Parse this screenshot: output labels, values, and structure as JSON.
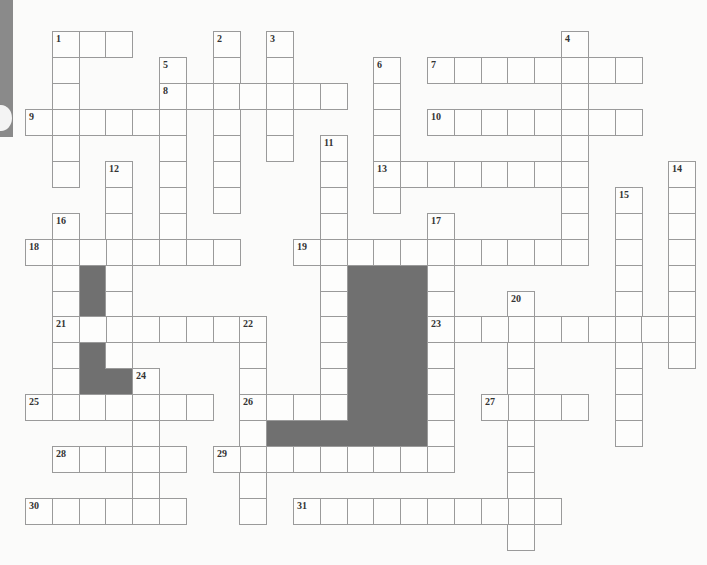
{
  "puzzle": {
    "type": "crossword",
    "grid_origin": {
      "x": 25,
      "y": 31
    },
    "cell_w": 26.8,
    "cell_h": 25.95,
    "colors": {
      "cell_border": "#9a9a9a",
      "block": "#707070",
      "background": "#fbfbfa",
      "edge_tab": "#8a8a8a"
    },
    "entries": [
      {
        "num": "1",
        "dir": "across",
        "row": 0,
        "col": 1,
        "len": 3
      },
      {
        "num": "1",
        "dir": "down",
        "row": 0,
        "col": 1,
        "len": 6
      },
      {
        "num": "2",
        "dir": "down",
        "row": 0,
        "col": 7,
        "len": 7
      },
      {
        "num": "3",
        "dir": "down",
        "row": 0,
        "col": 9,
        "len": 5
      },
      {
        "num": "4",
        "dir": "down",
        "row": 0,
        "col": 20,
        "len": 9
      },
      {
        "num": "5",
        "dir": "down",
        "row": 1,
        "col": 5,
        "len": 8
      },
      {
        "num": "6",
        "dir": "down",
        "row": 1,
        "col": 13,
        "len": 6
      },
      {
        "num": "7",
        "dir": "across",
        "row": 1,
        "col": 15,
        "len": 8
      },
      {
        "num": "8",
        "dir": "across",
        "row": 2,
        "col": 5,
        "len": 7
      },
      {
        "num": "9",
        "dir": "across",
        "row": 3,
        "col": 0,
        "len": 6
      },
      {
        "num": "10",
        "dir": "across",
        "row": 3,
        "col": 15,
        "len": 8
      },
      {
        "num": "11",
        "dir": "down",
        "row": 4,
        "col": 11,
        "len": 11
      },
      {
        "num": "12",
        "dir": "down",
        "row": 5,
        "col": 3,
        "len": 8
      },
      {
        "num": "13",
        "dir": "across",
        "row": 5,
        "col": 13,
        "len": 8
      },
      {
        "num": "14",
        "dir": "down",
        "row": 5,
        "col": 24,
        "len": 8
      },
      {
        "num": "15",
        "dir": "down",
        "row": 6,
        "col": 22,
        "len": 10
      },
      {
        "num": "16",
        "dir": "down",
        "row": 7,
        "col": 1,
        "len": 7
      },
      {
        "num": "17",
        "dir": "down",
        "row": 7,
        "col": 15,
        "len": 10
      },
      {
        "num": "18",
        "dir": "across",
        "row": 8,
        "col": 0,
        "len": 8
      },
      {
        "num": "19",
        "dir": "across",
        "row": 8,
        "col": 10,
        "len": 11
      },
      {
        "num": "20",
        "dir": "down",
        "row": 10,
        "col": 18,
        "len": 10
      },
      {
        "num": "21",
        "dir": "across",
        "row": 11,
        "col": 1,
        "len": 8
      },
      {
        "num": "22",
        "dir": "down",
        "row": 11,
        "col": 8,
        "len": 8
      },
      {
        "num": "23",
        "dir": "across",
        "row": 11,
        "col": 15,
        "len": 10
      },
      {
        "num": "24",
        "dir": "down",
        "row": 13,
        "col": 4,
        "len": 6
      },
      {
        "num": "25",
        "dir": "across",
        "row": 14,
        "col": 0,
        "len": 7
      },
      {
        "num": "26",
        "dir": "across",
        "row": 14,
        "col": 8,
        "len": 4
      },
      {
        "num": "27",
        "dir": "across",
        "row": 14,
        "col": 17,
        "len": 4
      },
      {
        "num": "28",
        "dir": "across",
        "row": 16,
        "col": 1,
        "len": 5
      },
      {
        "num": "29",
        "dir": "across",
        "row": 16,
        "col": 7,
        "len": 9
      },
      {
        "num": "30",
        "dir": "across",
        "row": 18,
        "col": 0,
        "len": 6
      },
      {
        "num": "31",
        "dir": "across",
        "row": 18,
        "col": 10,
        "len": 10
      }
    ],
    "blocks": [
      {
        "row": 9,
        "col": 2,
        "rows": 2,
        "cols": 1
      },
      {
        "row": 12,
        "col": 2,
        "rows": 2,
        "cols": 1
      },
      {
        "row": 13,
        "col": 3,
        "rows": 1,
        "cols": 1
      },
      {
        "row": 9,
        "col": 12,
        "rows": 7,
        "cols": 3
      },
      {
        "row": 15,
        "col": 9,
        "rows": 1,
        "cols": 3
      }
    ]
  }
}
